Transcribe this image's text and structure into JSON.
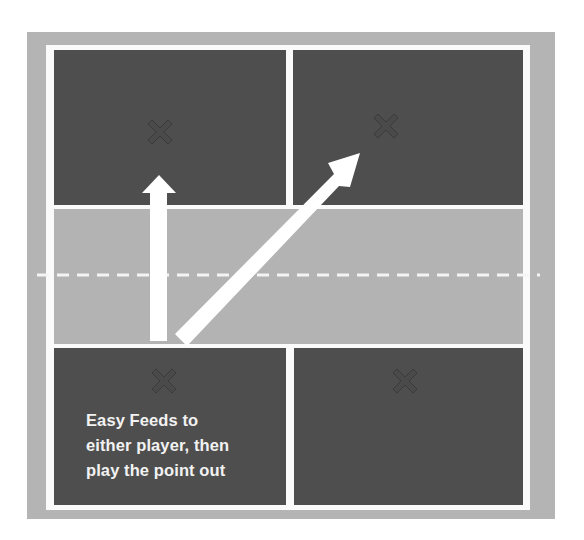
{
  "diagram": {
    "type": "pickleball-court-drill",
    "caption_lines": [
      "Easy Feeds to",
      "either player, then",
      "play the point out"
    ],
    "player_markers": [
      {
        "label": "X",
        "position": "top-left service box",
        "x": 160,
        "y": 133
      },
      {
        "label": "X",
        "position": "top-right service box",
        "x": 386,
        "y": 127
      },
      {
        "label": "X",
        "position": "bottom-left service box",
        "x": 164,
        "y": 382
      },
      {
        "label": "X",
        "position": "bottom-right service box",
        "x": 405,
        "y": 382
      }
    ],
    "arrows": [
      {
        "name": "straight-feed",
        "from": [
          159,
          341
        ],
        "to": [
          159,
          175
        ]
      },
      {
        "name": "crosscourt-feed",
        "from": [
          181,
          340
        ],
        "to": [
          360,
          153
        ]
      }
    ],
    "colors": {
      "outer_border": "#b4b4b4",
      "lines": "#fafafa",
      "service_box": "#4e4e4e",
      "kitchen": "#b3b3b3",
      "arrow": "#ffffff",
      "text": "#f2f2f2"
    }
  }
}
